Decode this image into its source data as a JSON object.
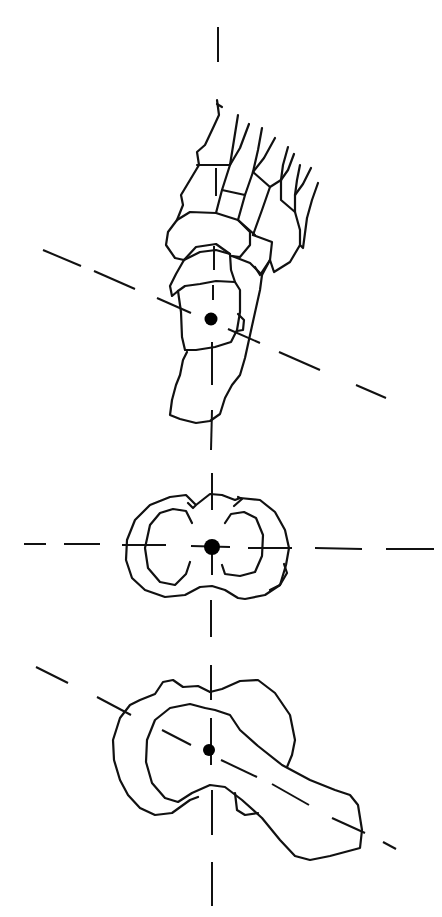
{
  "figure": {
    "type": "anatomical line drawing",
    "background": "#ffffff",
    "stroke_color": "#111111",
    "panels": [
      {
        "name": "foot-skeleton-top-view",
        "center": [
          211,
          319
        ],
        "axes": [
          "vertical-dashed",
          "oblique-dashed"
        ]
      },
      {
        "name": "talus-cross-section",
        "center": [
          212,
          547
        ],
        "axes": [
          "vertical-dashed",
          "horizontal-dashed"
        ]
      },
      {
        "name": "calcaneus-oblique-view",
        "center": [
          209,
          750
        ],
        "axes": [
          "vertical-dashed",
          "oblique-dashed"
        ]
      }
    ]
  }
}
